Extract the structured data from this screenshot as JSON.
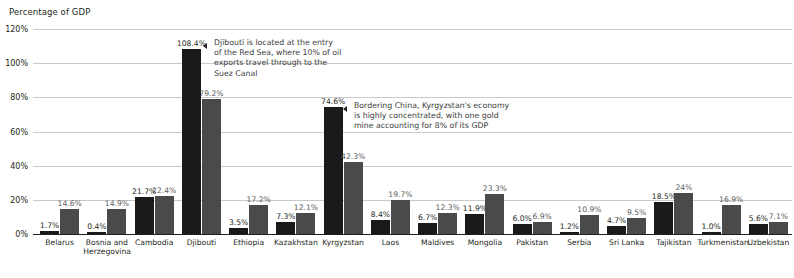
{
  "chart_data": {
    "type": "bar",
    "title": "",
    "ylabel": "Percentage of GDP",
    "xlabel": "",
    "ylim": [
      0,
      120
    ],
    "ytick_labels": [
      "0%",
      "20%",
      "40%",
      "60%",
      "80%",
      "100%",
      "120%"
    ],
    "ytick_values": [
      0,
      20,
      40,
      60,
      80,
      100,
      120
    ],
    "grid": true,
    "legend": "none",
    "categories": [
      "Belarus",
      "Bosnia and\nHerzegovina",
      "Cambodia",
      "Djibouti",
      "Ethiopia",
      "Kazakhstan",
      "Kyrgyzstan",
      "Laos",
      "Maldives",
      "Mongolia",
      "Pakistan",
      "Serbia",
      "Sri Lanka",
      "Tajikistan",
      "Turkmenistan",
      "Uzbekistan"
    ],
    "series": [
      {
        "name": "series-1",
        "color": "#1a1a1a",
        "values": [
          1.7,
          0.4,
          21.7,
          108.4,
          3.5,
          7.3,
          74.6,
          8.4,
          6.7,
          11.9,
          6.0,
          1.2,
          4.7,
          18.5,
          1.0,
          5.6
        ],
        "labels": [
          "1.7%",
          "0.4%",
          "21.7%",
          "108.4%",
          "3.5%",
          "7.3%",
          "74.6%",
          "8.4%",
          "6.7%",
          "11.9%",
          "6.0%",
          "1.2%",
          "4.7%",
          "18.5%",
          "1.0%",
          "5.6%"
        ]
      },
      {
        "name": "series-2",
        "color": "#4a4a4a",
        "values": [
          14.6,
          14.9,
          22.4,
          79.2,
          17.2,
          12.1,
          42.3,
          19.7,
          12.3,
          23.3,
          6.9,
          10.9,
          9.5,
          24.0,
          16.9,
          7.1
        ],
        "labels": [
          "14.6%",
          "14.9%",
          "22.4%",
          "79.2%",
          "17.2%",
          "12.1%",
          "42.3%",
          "19.7%",
          "12.3%",
          "23.3%",
          "6.9%",
          "10.9%",
          "9.5%",
          "24%",
          "16.9%",
          "7.1%"
        ]
      }
    ],
    "annotations": [
      {
        "id": "djibouti-note",
        "text": "Djibouti is located at the entry\nof the Red Sea, where 10% of oil\nexports travel through to the\nSuez Canal",
        "target": "Djibouti"
      },
      {
        "id": "kyrgyzstan-note",
        "text": "Bordering China, Kyrgyzstan's economy\nis highly concentrated, with one gold\nmine accounting for 8% of its GDP",
        "target": "Kyrgyzstan"
      }
    ]
  },
  "flags": [
    {
      "country": "Belarus",
      "icon": "flag-icon-belarus"
    },
    {
      "country": "Bosnia and Herzegovina",
      "icon": "flag-icon-bosnia-and-herzegovina"
    },
    {
      "country": "Cambodia",
      "icon": "flag-icon-cambodia"
    },
    {
      "country": "Djibouti",
      "icon": "flag-icon-djibouti"
    },
    {
      "country": "Ethiopia",
      "icon": "flag-icon-ethiopia"
    },
    {
      "country": "Kazakhstan",
      "icon": "flag-icon-kazakhstan"
    },
    {
      "country": "Kyrgyzstan",
      "icon": "flag-icon-kyrgyzstan"
    },
    {
      "country": "Laos",
      "icon": "flag-icon-laos"
    },
    {
      "country": "Maldives",
      "icon": "flag-icon-maldives"
    },
    {
      "country": "Mongolia",
      "icon": "flag-icon-mongolia"
    },
    {
      "country": "Pakistan",
      "icon": "flag-icon-pakistan"
    },
    {
      "country": "Serbia",
      "icon": "flag-icon-serbia"
    },
    {
      "country": "Sri Lanka",
      "icon": "flag-icon-sri-lanka"
    },
    {
      "country": "Tajikistan",
      "icon": "flag-icon-tajikistan"
    },
    {
      "country": "Turkmenistan",
      "icon": "flag-icon-turkmenistan"
    },
    {
      "country": "Uzbekistan",
      "icon": "flag-icon-uzbekistan"
    }
  ],
  "colors": {
    "series1": "#1a1a1a",
    "series2": "#4a4a4a",
    "gridline": "#c9c9c9",
    "baseline": "#231f20",
    "text": "#231f20",
    "background": "#ffffff"
  }
}
